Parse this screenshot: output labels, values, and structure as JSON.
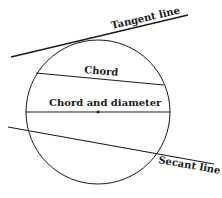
{
  "diagram": {
    "type": "circle-lines",
    "labels": {
      "tangent": "Tangent line",
      "chord": "Chord",
      "diameter": "Chord and diameter",
      "secant": "Secant line"
    },
    "colors": {
      "stroke": "#1a1a1a",
      "background": "#ffffff"
    }
  }
}
